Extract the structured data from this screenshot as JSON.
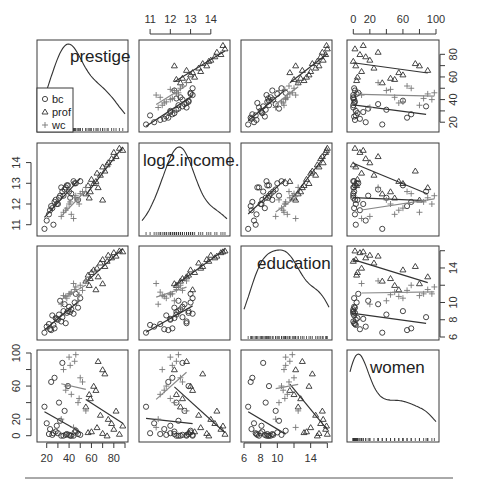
{
  "chart_data": {
    "type": "scatter",
    "variables": [
      "prestige",
      "log2.income.",
      "education",
      "women"
    ],
    "groups": [
      {
        "name": "bc",
        "symbol": "circle",
        "color": "#333333",
        "line_color": "#333333"
      },
      {
        "name": "prof",
        "symbol": "triangle",
        "color": "#333333",
        "line_color": "#333333"
      },
      {
        "name": "wc",
        "symbol": "plus",
        "color": "#777777",
        "line_color": "#888888"
      }
    ],
    "ranges": {
      "prestige": [
        14,
        90
      ],
      "log2.income.": [
        10.6,
        14.8
      ],
      "education": [
        6,
        16.2
      ],
      "women": [
        -4,
        100
      ]
    },
    "axes": {
      "top": [
        {
          "col": 1,
          "ticks": [
            11,
            12,
            13,
            14
          ],
          "labels": [
            "11",
            "12",
            "13",
            "14"
          ]
        },
        {
          "col": 3,
          "ticks": [
            0,
            20,
            40,
            60,
            80,
            100
          ],
          "labels": [
            "0",
            "20",
            "",
            "60",
            "",
            "100"
          ]
        }
      ],
      "bottom": [
        {
          "col": 0,
          "ticks": [
            20,
            30,
            40,
            50,
            60,
            70,
            80,
            90
          ],
          "labels": [
            "20",
            "",
            "40",
            "",
            "60",
            "",
            "80",
            ""
          ]
        },
        {
          "col": 2,
          "ticks": [
            6,
            8,
            10,
            12,
            14,
            16
          ],
          "labels": [
            "6",
            "8",
            "10",
            "",
            "14",
            ""
          ]
        }
      ],
      "left": [
        {
          "row": 1,
          "ticks": [
            11,
            12,
            13,
            14
          ],
          "labels": [
            "11",
            "12",
            "13",
            "14"
          ]
        },
        {
          "row": 3,
          "ticks": [
            0,
            20,
            40,
            60,
            80,
            100
          ],
          "labels": [
            "0",
            "20",
            "",
            "60",
            "",
            "100"
          ]
        }
      ],
      "right": [
        {
          "row": 0,
          "ticks": [
            20,
            30,
            40,
            50,
            60,
            70,
            80
          ],
          "labels": [
            "20",
            "",
            "40",
            "",
            "60",
            "",
            "80"
          ]
        },
        {
          "row": 2,
          "ticks": [
            6,
            8,
            10,
            12,
            14,
            16
          ],
          "labels": [
            "6",
            "8",
            "10",
            "",
            "14",
            ""
          ]
        }
      ]
    },
    "legend": {
      "position": "inside top-left panel, bottom-left",
      "entries": [
        "bc",
        "prof",
        "wc"
      ]
    },
    "grid": false,
    "points": {
      "bc": [
        [
          25,
          11.8,
          8.5,
          1
        ],
        [
          22,
          11.5,
          7.5,
          2
        ],
        [
          30,
          12.0,
          8.0,
          3
        ],
        [
          35,
          12.4,
          9.0,
          0
        ],
        [
          28,
          12.2,
          8.2,
          5
        ],
        [
          40,
          12.6,
          9.5,
          1
        ],
        [
          33,
          12.8,
          7.8,
          0
        ],
        [
          38,
          12.9,
          8.8,
          2
        ],
        [
          45,
          13.0,
          10.0,
          4
        ],
        [
          50,
          13.1,
          10.5,
          1
        ],
        [
          42,
          12.5,
          9.2,
          0
        ],
        [
          27,
          12.1,
          7.0,
          70
        ],
        [
          24,
          11.9,
          6.8,
          65
        ],
        [
          31,
          12.3,
          8.6,
          40
        ],
        [
          36,
          12.7,
          9.8,
          30
        ],
        [
          20,
          11.2,
          7.2,
          15
        ],
        [
          18,
          10.8,
          6.5,
          35
        ],
        [
          26,
          11.0,
          7.4,
          3
        ],
        [
          34,
          12.6,
          8.3,
          88
        ],
        [
          39,
          12.9,
          9.0,
          60
        ],
        [
          29,
          12.0,
          8.1,
          12
        ],
        [
          32,
          12.4,
          10.2,
          18
        ],
        [
          44,
          13.1,
          8.7,
          0
        ],
        [
          48,
          12.2,
          9.4,
          2
        ],
        [
          23,
          11.7,
          6.9,
          8
        ],
        [
          37,
          12.8,
          7.6,
          1
        ],
        [
          41,
          12.3,
          8.9,
          0
        ],
        [
          46,
          13.0,
          11.0,
          6
        ]
      ],
      "prof": [
        [
          60,
          13.2,
          13.5,
          5
        ],
        [
          65,
          13.5,
          14.0,
          10
        ],
        [
          70,
          13.8,
          15.0,
          3
        ],
        [
          75,
          14.0,
          15.5,
          20
        ],
        [
          80,
          14.5,
          15.8,
          8
        ],
        [
          85,
          14.7,
          16.0,
          2
        ],
        [
          55,
          12.5,
          12.5,
          35
        ],
        [
          58,
          12.3,
          12.0,
          50
        ],
        [
          62,
          13.0,
          13.8,
          60
        ],
        [
          68,
          13.4,
          14.6,
          25
        ],
        [
          72,
          13.6,
          14.2,
          75
        ],
        [
          78,
          14.2,
          15.2,
          15
        ],
        [
          66,
          12.8,
          13.0,
          90
        ],
        [
          59,
          12.6,
          12.8,
          45
        ],
        [
          82,
          14.3,
          15.4,
          30
        ],
        [
          74,
          13.9,
          14.8,
          0
        ],
        [
          64,
          13.1,
          11.5,
          55
        ],
        [
          70,
          12.2,
          12.2,
          80
        ],
        [
          88,
          14.6,
          15.9,
          12
        ],
        [
          57,
          12.9,
          13.2,
          4
        ]
      ],
      "wc": [
        [
          40,
          12.0,
          11.0,
          95
        ],
        [
          45,
          12.3,
          11.5,
          90
        ],
        [
          35,
          11.6,
          10.8,
          80
        ],
        [
          50,
          12.5,
          12.0,
          70
        ],
        [
          38,
          11.8,
          10.5,
          60
        ],
        [
          42,
          11.5,
          11.2,
          50
        ],
        [
          48,
          12.2,
          10.2,
          40
        ],
        [
          55,
          12.8,
          12.5,
          30
        ],
        [
          33,
          11.4,
          9.8,
          20
        ],
        [
          46,
          12.4,
          11.8,
          98
        ],
        [
          52,
          12.6,
          11.4,
          65
        ],
        [
          37,
          11.7,
          10.7,
          55
        ],
        [
          44,
          11.3,
          12.2,
          10
        ],
        [
          41,
          12.1,
          11.0,
          85
        ],
        [
          49,
          12.0,
          10.9,
          45
        ]
      ]
    }
  },
  "labels": {
    "var0": "prestige",
    "var1": "log2.income.",
    "var2": "education",
    "var3": "women",
    "legend_bc": "bc",
    "legend_prof": "prof",
    "legend_wc": "wc"
  }
}
